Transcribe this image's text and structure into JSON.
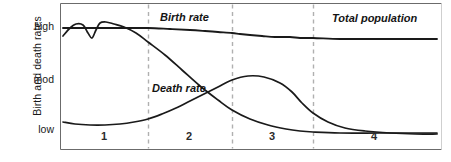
{
  "chart_data": {
    "type": "line",
    "title": "",
    "xlabel": "",
    "ylabel": "Birth and death rates",
    "y_tick_labels": [
      "high",
      "mod",
      "low"
    ],
    "y_tick_pixels": [
      27,
      80,
      130
    ],
    "grid": false,
    "legend_position": "inline-annotations",
    "x_range_stages": [
      "1",
      "2",
      "3",
      "4"
    ],
    "stage_boundaries_x": [
      148,
      232,
      313
    ],
    "annotations": [
      {
        "text": "Birth rate",
        "x": 160,
        "y": 12
      },
      {
        "text": "Death rate",
        "x": 152,
        "y": 82
      },
      {
        "text": "Total population",
        "x": 332,
        "y": 13
      }
    ],
    "series": [
      {
        "name": "Birth rate",
        "color": "#1a1a1a",
        "description": "High and fluctuating in stage 1, high and steady through stage 2, falls rapidly in stage 3, low and fluctuating in stage 4",
        "points": [
          [
            63,
            36
          ],
          [
            70,
            28
          ],
          [
            76,
            24
          ],
          [
            83,
            25
          ],
          [
            88,
            33
          ],
          [
            92,
            38
          ],
          [
            96,
            30
          ],
          [
            100,
            23
          ],
          [
            106,
            22
          ],
          [
            114,
            24
          ],
          [
            124,
            27
          ],
          [
            136,
            33
          ],
          [
            148,
            42
          ],
          [
            165,
            55
          ],
          [
            182,
            70
          ],
          [
            200,
            86
          ],
          [
            218,
            100
          ],
          [
            232,
            110
          ],
          [
            250,
            119
          ],
          [
            268,
            125
          ],
          [
            286,
            129
          ],
          [
            300,
            131
          ],
          [
            313,
            132
          ],
          [
            340,
            133
          ],
          [
            380,
            133
          ],
          [
            420,
            133
          ],
          [
            437,
            133
          ]
        ]
      },
      {
        "name": "Death rate",
        "color": "#1a1a1a",
        "description": "High and fluctuating in stage 1, falls rapidly in stage 2, low in stages 3 and 4",
        "points": [
          [
            63,
            122
          ],
          [
            75,
            124
          ],
          [
            90,
            125
          ],
          [
            105,
            125
          ],
          [
            120,
            124
          ],
          [
            134,
            122
          ],
          [
            148,
            119
          ],
          [
            162,
            114
          ],
          [
            176,
            108
          ],
          [
            190,
            101
          ],
          [
            204,
            94
          ],
          [
            218,
            87
          ],
          [
            232,
            80
          ],
          [
            248,
            76
          ],
          [
            264,
            77
          ],
          [
            280,
            83
          ],
          [
            292,
            92
          ],
          [
            302,
            103
          ],
          [
            313,
            113
          ],
          [
            328,
            122
          ],
          [
            345,
            128
          ],
          [
            365,
            131
          ],
          [
            390,
            133
          ],
          [
            415,
            134
          ],
          [
            437,
            134
          ]
        ]
      },
      {
        "name": "Total population",
        "color": "#1a1a1a",
        "description": "Low and steady in stage 1, rises rapidly in stages 2 and 3, high and steady in stage 4",
        "points": [
          [
            63,
            28
          ],
          [
            90,
            28
          ],
          [
            120,
            28
          ],
          [
            148,
            28
          ],
          [
            170,
            29
          ],
          [
            190,
            30
          ],
          [
            205,
            31
          ],
          [
            218,
            32
          ],
          [
            232,
            33
          ],
          [
            240,
            34
          ],
          [
            250,
            35
          ],
          [
            262,
            36
          ],
          [
            275,
            37
          ],
          [
            290,
            37
          ],
          [
            300,
            38
          ],
          [
            313,
            38
          ],
          [
            340,
            39
          ],
          [
            370,
            39
          ],
          [
            400,
            39
          ],
          [
            437,
            39
          ]
        ]
      }
    ]
  },
  "axis": {
    "y_label": "Birth and death rates",
    "ticks": [
      {
        "label": "high",
        "top": 20
      },
      {
        "label": "mod",
        "top": 73
      },
      {
        "label": "low",
        "top": 123
      }
    ]
  },
  "stages": [
    {
      "label": "1",
      "x": 104
    },
    {
      "label": "2",
      "x": 189
    },
    {
      "label": "3",
      "x": 272
    },
    {
      "label": "4",
      "x": 374
    }
  ],
  "labels": {
    "birth_rate": "Birth rate",
    "death_rate": "Death rate",
    "total_population": "Total population"
  },
  "colors": {
    "curve": "#1a1a1a",
    "frame": "#6b6b6b",
    "dashed": "#b0b0b0",
    "text": "#1a1a1a"
  }
}
